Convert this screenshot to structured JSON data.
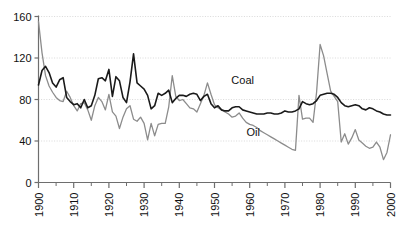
{
  "chart_data": {
    "type": "line",
    "title": "",
    "subtitle": "",
    "xlabel": "",
    "ylabel": "",
    "xlim": [
      1900,
      2000
    ],
    "ylim": [
      0,
      160
    ],
    "grid": true,
    "grid_axis": "y",
    "legend_position": "inline-annotation",
    "y_ticks": [
      0,
      40,
      80,
      120,
      160
    ],
    "x_ticks": [
      1900,
      1910,
      1920,
      1930,
      1940,
      1950,
      1960,
      1970,
      1980,
      1990,
      2000
    ],
    "x_minor_ticks": [
      1905,
      1915,
      1925,
      1935,
      1945,
      1955,
      1965,
      1975,
      1985,
      1995
    ],
    "x_tick_labels": [
      "1900",
      "1910",
      "1920",
      "1930",
      "1940",
      "1950",
      "1960",
      "1970",
      "1980",
      "1990",
      "2000"
    ],
    "y_tick_labels": [
      "0",
      "40",
      "80",
      "120",
      "160"
    ],
    "x_tick_label_rotation": -90,
    "annotations": [
      {
        "text": "Coal",
        "x": 1958,
        "y": 95,
        "series": "Coal"
      },
      {
        "text": "Oil",
        "x": 1961,
        "y": 45,
        "series": "Oil"
      }
    ],
    "series": [
      {
        "name": "Coal",
        "color": "#1a1a1a",
        "width": 1.6,
        "x": [
          1900,
          1901,
          1902,
          1903,
          1904,
          1905,
          1906,
          1907,
          1908,
          1909,
          1910,
          1911,
          1912,
          1913,
          1914,
          1915,
          1916,
          1917,
          1918,
          1919,
          1920,
          1921,
          1922,
          1923,
          1924,
          1925,
          1926,
          1927,
          1928,
          1929,
          1930,
          1931,
          1932,
          1933,
          1934,
          1935,
          1936,
          1937,
          1938,
          1939,
          1940,
          1941,
          1942,
          1943,
          1944,
          1945,
          1946,
          1947,
          1948,
          1949,
          1950,
          1951,
          1952,
          1953,
          1954,
          1955,
          1956,
          1957,
          1958,
          1959,
          1960,
          1961,
          1962,
          1963,
          1964,
          1965,
          1966,
          1967,
          1968,
          1969,
          1970,
          1971,
          1972,
          1973,
          1974,
          1975,
          1976,
          1977,
          1978,
          1979,
          1980,
          1981,
          1982,
          1983,
          1984,
          1985,
          1986,
          1987,
          1988,
          1989,
          1990,
          1991,
          1992,
          1993,
          1994,
          1995,
          1996,
          1997,
          1998,
          1999,
          2000
        ],
        "values": [
          94,
          108,
          112,
          106,
          96,
          92,
          99,
          101,
          82,
          78,
          75,
          76,
          72,
          80,
          72,
          74,
          84,
          100,
          101,
          98,
          109,
          83,
          102,
          98,
          82,
          77,
          97,
          124,
          96,
          93,
          90,
          84,
          71,
          74,
          86,
          84,
          86,
          89,
          77,
          81,
          84,
          84,
          83,
          85,
          86,
          85,
          79,
          83,
          85,
          76,
          72,
          74,
          70,
          69,
          69,
          72,
          73,
          73,
          70,
          69,
          68,
          67,
          66,
          66,
          66,
          67,
          67,
          66,
          66,
          67,
          69,
          68,
          68,
          69,
          71,
          78,
          76,
          75,
          76,
          79,
          84,
          85,
          86,
          86,
          85,
          82,
          77,
          74,
          73,
          74,
          75,
          74,
          71,
          70,
          72,
          71,
          69,
          68,
          66,
          65,
          65
        ]
      },
      {
        "name": "Oil",
        "color": "#8c8c8c",
        "width": 1.3,
        "x": [
          1900,
          1901,
          1902,
          1903,
          1904,
          1905,
          1906,
          1907,
          1908,
          1909,
          1910,
          1911,
          1912,
          1913,
          1914,
          1915,
          1916,
          1917,
          1918,
          1919,
          1920,
          1921,
          1922,
          1923,
          1924,
          1925,
          1926,
          1927,
          1928,
          1929,
          1930,
          1931,
          1932,
          1933,
          1934,
          1935,
          1936,
          1937,
          1938,
          1939,
          1940,
          1941,
          1942,
          1943,
          1944,
          1945,
          1946,
          1947,
          1948,
          1949,
          1950,
          1951,
          1952,
          1953,
          1954,
          1955,
          1956,
          1957,
          1958,
          1959,
          1960,
          1961,
          1962,
          1963,
          1964,
          1965,
          1966,
          1967,
          1968,
          1969,
          1970,
          1971,
          1972,
          1973,
          1974,
          1975,
          1976,
          1977,
          1978,
          1979,
          1980,
          1981,
          1982,
          1983,
          1984,
          1985,
          1986,
          1987,
          1988,
          1989,
          1990,
          1991,
          1992,
          1993,
          1994,
          1995,
          1996,
          1997,
          1998,
          1999,
          2000
        ],
        "values": [
          155,
          125,
          103,
          93,
          87,
          82,
          79,
          78,
          88,
          82,
          74,
          69,
          76,
          77,
          70,
          60,
          74,
          82,
          78,
          70,
          85,
          68,
          64,
          52,
          63,
          71,
          74,
          61,
          59,
          63,
          57,
          41,
          57,
          45,
          56,
          57,
          57,
          73,
          103,
          83,
          79,
          80,
          76,
          72,
          71,
          68,
          76,
          84,
          96,
          85,
          75,
          72,
          70,
          68,
          66,
          63,
          64,
          67,
          62,
          58,
          56,
          55,
          53,
          50,
          48,
          46,
          44,
          42,
          40,
          38,
          36,
          34,
          32,
          31,
          84,
          61,
          62,
          62,
          58,
          87,
          133,
          122,
          105,
          88,
          83,
          78,
          39,
          47,
          37,
          43,
          51,
          41,
          38,
          35,
          33,
          34,
          39,
          34,
          22,
          29,
          46
        ]
      }
    ]
  },
  "axis": {
    "y_label_values": [
      "160",
      "120",
      "80",
      "40",
      "0"
    ],
    "x_label_values": [
      "1900",
      "1910",
      "1920",
      "1930",
      "1940",
      "1950",
      "1960",
      "1970",
      "1980",
      "1990",
      "2000"
    ]
  },
  "labels": {
    "coal": "Coal",
    "oil": "Oil"
  },
  "colors": {
    "coal_line": "#1a1a1a",
    "oil_line": "#8c8c8c",
    "axis": "#6e6e6e",
    "grid": "#cfcfcf",
    "text": "#111111",
    "background": "#ffffff"
  }
}
